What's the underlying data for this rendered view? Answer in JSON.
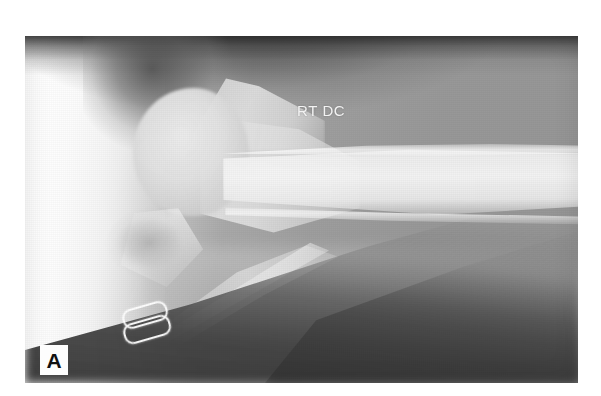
{
  "figure": {
    "panel_letter": "A",
    "modality": "radiograph",
    "projection_label": "RT DC",
    "background_color": "#ffffff",
    "plate_color": "#9a9a9a",
    "annotation_text_color": "#f3f3f3",
    "panel_label_background": "#fdfdfd",
    "panel_label_color": "#111111",
    "plate": {
      "left": 25,
      "top": 36,
      "width": 553,
      "height": 347
    }
  },
  "annotations": [
    {
      "id": "view-label",
      "text": "RT DC",
      "meaning": "right distal / craniocaudal view marker",
      "color": "#f3f3f3"
    },
    {
      "id": "panel-label",
      "text": "A",
      "meaning": "figure panel identifier",
      "color": "#111111"
    }
  ],
  "anatomy": [
    {
      "id": "bone-head",
      "label": "rounded articular bone head"
    },
    {
      "id": "bone-tubercle",
      "label": "tubercle / trochanteric ridge"
    },
    {
      "id": "bone-metaphysis",
      "label": "metaphysis and neck"
    },
    {
      "id": "bone-shaft",
      "label": "long bone diaphysis"
    },
    {
      "id": "bone-secondary",
      "label": "secondary bone sloping caudally"
    },
    {
      "id": "joint-lucency",
      "label": "joint space lucency"
    },
    {
      "id": "bone-spur",
      "label": "caudal bony spur"
    },
    {
      "id": "staples",
      "label": "radiopaque surgical staples"
    }
  ]
}
